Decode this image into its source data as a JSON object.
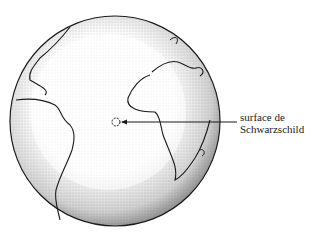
{
  "figure": {
    "label": {
      "line1": "surface de",
      "line2": "Schwarzschild"
    },
    "colors": {
      "ink": "#1a1a1a",
      "background": "#ffffff",
      "shade": "#9a9a9a"
    }
  }
}
